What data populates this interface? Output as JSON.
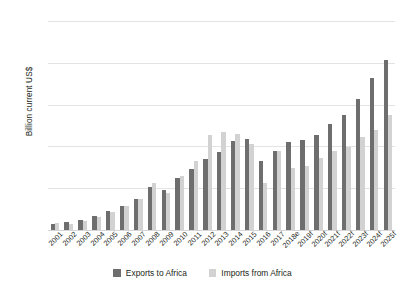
{
  "chart_data": {
    "type": "bar",
    "title": "",
    "xlabel": "",
    "ylabel": "Billion current US$",
    "ylim": [
      0,
      250
    ],
    "yticks": [
      0,
      50,
      100,
      150,
      200,
      250
    ],
    "grid": true,
    "legend_position": "bottom",
    "categories": [
      "2001",
      "2002",
      "2003",
      "2004",
      "2005",
      "2006",
      "2007",
      "2008",
      "2009",
      "2010",
      "2011",
      "2012",
      "2013",
      "2014",
      "2015",
      "2016",
      "2017",
      "2018e",
      "2019f",
      "2020f",
      "2021f",
      "2022f",
      "2023f",
      "2024f",
      "2025f"
    ],
    "series": [
      {
        "name": "Exports to Africa",
        "color": "#6e6e6e",
        "values": [
          7,
          9,
          12,
          17,
          23,
          29,
          37,
          51,
          48,
          62,
          73,
          85,
          93,
          106,
          109,
          83,
          95,
          105,
          108,
          114,
          127,
          137,
          157,
          182,
          203
        ]
      },
      {
        "name": "Imports from Africa",
        "color": "#d2d2d2",
        "values": [
          8,
          7,
          11,
          16,
          22,
          29,
          37,
          56,
          44,
          65,
          82,
          114,
          117,
          115,
          103,
          56,
          95,
          74,
          77,
          86,
          95,
          99,
          111,
          120,
          138
        ]
      }
    ]
  },
  "legend": {
    "items": [
      {
        "label": "Exports to Africa",
        "key": "exports"
      },
      {
        "label": "Imports from Africa",
        "key": "imports"
      }
    ]
  }
}
